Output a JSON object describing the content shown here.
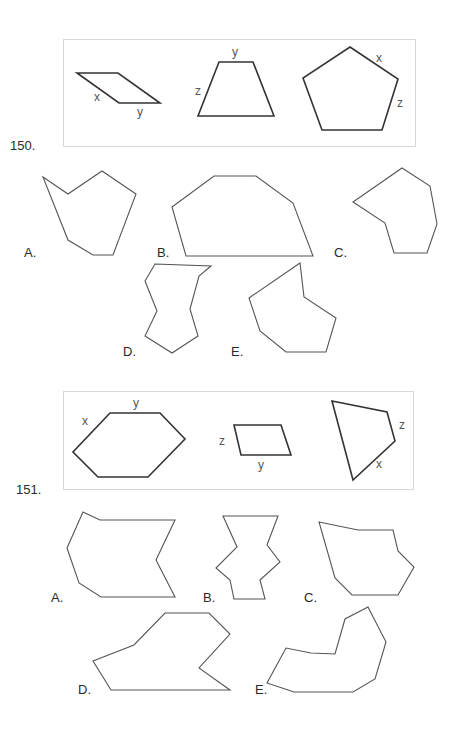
{
  "colors": {
    "reference_stroke": "#333333",
    "option_stroke": "#555555",
    "box_border": "#d8d8d8",
    "text": "#2a2a2a",
    "side_label": "#555555"
  },
  "questions": [
    {
      "number": "150.",
      "reference_box": {
        "shapes": [
          {
            "name": "parallelogram",
            "points": "77,73 118,73 160,103 119,103",
            "side_labels": [
              {
                "text": "x",
                "x": 94,
                "y": 90
              },
              {
                "text": "y",
                "x": 137,
                "y": 105
              }
            ]
          },
          {
            "name": "trapezoid",
            "points": "219,62 253,62 274,116 198,116",
            "side_labels": [
              {
                "text": "y",
                "x": 232,
                "y": 45
              },
              {
                "text": "z",
                "x": 195,
                "y": 84
              }
            ]
          },
          {
            "name": "pentagon",
            "points": "350,47 398,79 382,130 322,130 303,78",
            "side_labels": [
              {
                "text": "x",
                "x": 376,
                "y": 51
              },
              {
                "text": "z",
                "x": 397,
                "y": 96
              }
            ]
          }
        ]
      },
      "options": [
        {
          "label": "A.",
          "label_x": 24,
          "label_y": 245,
          "points": "43,177 68,194 102,171 136,194 113,255 93,255 68,240"
        },
        {
          "label": "B.",
          "label_x": 157,
          "label_y": 245,
          "points": "172,207 214,176 256,176 293,203 313,256 186,256"
        },
        {
          "label": "C.",
          "label_x": 334,
          "label_y": 245,
          "points": "402,168 430,186 437,224 427,253 394,253 385,223 353,202"
        },
        {
          "label": "D.",
          "label_x": 123,
          "label_y": 344,
          "points": "155,264 211,266 199,276 190,309 198,336 172,353 145,336 157,311 145,281"
        },
        {
          "label": "E.",
          "label_x": 231,
          "label_y": 344,
          "points": "300,263 304,297 336,318 326,352 286,352 260,331 249,298"
        }
      ]
    },
    {
      "number": "151.",
      "reference_box": {
        "shapes": [
          {
            "name": "hexagon",
            "points": "110,413 160,413 185,439 148,477 98,477 73,452",
            "side_labels": [
              {
                "text": "y",
                "x": 133,
                "y": 396
              },
              {
                "text": "x",
                "x": 82,
                "y": 414
              }
            ]
          },
          {
            "name": "small-parallelogram",
            "points": "234,425 281,425 291,455 241,455",
            "side_labels": [
              {
                "text": "z",
                "x": 219,
                "y": 434
              },
              {
                "text": "y",
                "x": 258,
                "y": 458
              }
            ]
          },
          {
            "name": "quadrilateral",
            "points": "332,401 387,412 395,441 353,480",
            "side_labels": [
              {
                "text": "z",
                "x": 399,
                "y": 418
              },
              {
                "text": "x",
                "x": 376,
                "y": 457
              }
            ]
          }
        ]
      },
      "options": [
        {
          "label": "A.",
          "label_x": 51,
          "label_y": 590,
          "points": "83,512 100,520 175,520 156,560 175,597 101,597 79,583 67,548"
        },
        {
          "label": "B.",
          "label_x": 203,
          "label_y": 590,
          "points": "223,516 278,516 267,545 280,562 260,580 265,599 234,599 230,580 216,568 237,547"
        },
        {
          "label": "C.",
          "label_x": 304,
          "label_y": 590,
          "points": "319,522 358,530 393,530 398,551 414,567 398,595 352,595 335,578"
        },
        {
          "label": "D.",
          "label_x": 78,
          "label_y": 682,
          "points": "93,661 134,645 165,613 209,613 230,634 199,668 230,690 111,690"
        },
        {
          "label": "E.",
          "label_x": 255,
          "label_y": 682,
          "points": "368,607 386,642 375,679 353,692 294,692 267,683 286,648 311,653 335,654 345,619"
        }
      ]
    }
  ]
}
